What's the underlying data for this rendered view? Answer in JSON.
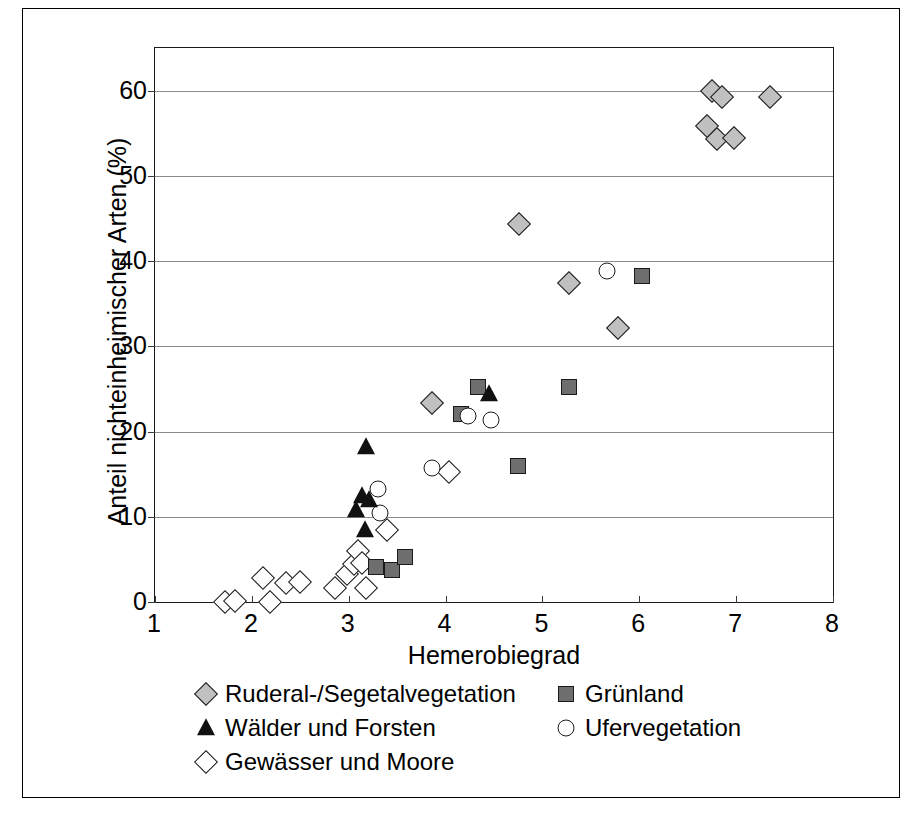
{
  "chart_data": {
    "type": "scatter",
    "title": "",
    "xlabel": "Hemerobiegrad",
    "ylabel": "Anteil nichteinheimischer Arten (%)",
    "xlim": [
      1,
      8
    ],
    "ylim": [
      0,
      65
    ],
    "xticks": [
      1,
      2,
      3,
      4,
      5,
      6,
      7,
      8
    ],
    "yticks": [
      0,
      10,
      20,
      30,
      40,
      50,
      60
    ],
    "grid": "horizontal",
    "legend_position": "below-plot",
    "series": [
      {
        "name": "Ruderal-/Segetalvegetation",
        "marker": "diamond-filled",
        "color": "#c0c0c0",
        "points": [
          [
            3.86,
            23.3
          ],
          [
            4.76,
            44.3
          ],
          [
            5.27,
            37.4
          ],
          [
            5.78,
            32.2
          ],
          [
            6.7,
            55.8
          ],
          [
            6.75,
            60.0
          ],
          [
            6.85,
            59.3
          ],
          [
            6.8,
            54.3
          ],
          [
            6.98,
            54.4
          ],
          [
            7.35,
            59.2
          ]
        ]
      },
      {
        "name": "Grünland",
        "marker": "square-filled",
        "color": "#6e6e6e",
        "points": [
          [
            3.28,
            4.1
          ],
          [
            3.45,
            3.7
          ],
          [
            3.58,
            5.3
          ],
          [
            4.16,
            22.0
          ],
          [
            4.33,
            25.2
          ],
          [
            4.75,
            16.0
          ],
          [
            5.27,
            25.2
          ],
          [
            6.03,
            38.3
          ]
        ]
      },
      {
        "name": "Wälder und Forsten",
        "marker": "triangle-filled",
        "color": "#111111",
        "points": [
          [
            3.08,
            10.8
          ],
          [
            3.14,
            12.4
          ],
          [
            3.21,
            12.0
          ],
          [
            3.18,
            18.2
          ],
          [
            3.17,
            8.4
          ],
          [
            4.45,
            24.4
          ]
        ]
      },
      {
        "name": "Ufervegetation",
        "marker": "circle-open",
        "color": "#ffffff",
        "points": [
          [
            3.3,
            13.2
          ],
          [
            3.32,
            10.5
          ],
          [
            3.86,
            15.7
          ],
          [
            4.23,
            21.8
          ],
          [
            4.47,
            21.3
          ],
          [
            5.67,
            38.8
          ]
        ]
      },
      {
        "name": "Gewässer und Moore",
        "marker": "diamond-open",
        "color": "#ffffff",
        "points": [
          [
            1.72,
            0.0
          ],
          [
            1.83,
            0.1
          ],
          [
            2.12,
            2.8
          ],
          [
            2.19,
            0.0
          ],
          [
            2.35,
            2.2
          ],
          [
            2.5,
            2.3
          ],
          [
            2.86,
            1.7
          ],
          [
            2.98,
            3.3
          ],
          [
            3.05,
            4.4
          ],
          [
            3.1,
            6.0
          ],
          [
            3.14,
            4.6
          ],
          [
            3.18,
            1.7
          ],
          [
            3.4,
            8.5
          ],
          [
            4.04,
            15.2
          ]
        ]
      }
    ]
  },
  "legend": {
    "rows": [
      {
        "left": {
          "label": "Ruderal-/Segetalvegetation",
          "marker": "diamond-filled"
        },
        "right": {
          "label": "Grünland",
          "marker": "square-filled"
        }
      },
      {
        "left": {
          "label": "Wälder und Forsten",
          "marker": "triangle-filled"
        },
        "right": {
          "label": "Ufervegetation",
          "marker": "circle-open"
        }
      },
      {
        "left": {
          "label": "Gewässer und Moore",
          "marker": "diamond-open"
        },
        "right": null
      }
    ]
  }
}
